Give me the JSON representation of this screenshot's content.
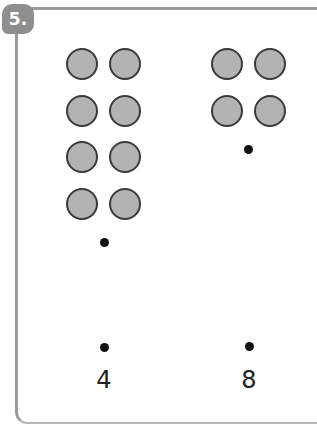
{
  "question": {
    "number_label": "5.",
    "groups": [
      {
        "id": "left",
        "counter_count": 8,
        "layout": "2 columns x 4 rows",
        "answer_label": "4"
      },
      {
        "id": "right",
        "counter_count": 4,
        "layout": "2 columns x 2 rows",
        "answer_label": "8"
      }
    ]
  },
  "colors": {
    "frame_border": "#9a9a9a",
    "badge_bg": "#8e8e8e",
    "counter_fill": "#b3b3b3",
    "counter_outline": "#3a3a3a",
    "dot": "#111111"
  }
}
